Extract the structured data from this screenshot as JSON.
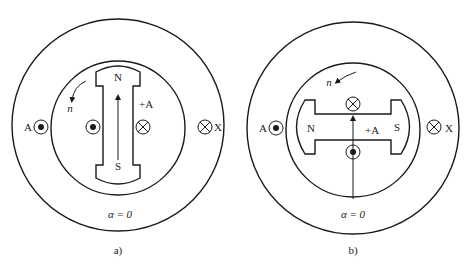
{
  "figure_a": {
    "caption": "a)",
    "angle_label": "α = 0",
    "rotor_north": "N",
    "rotor_south": "S",
    "axis_label": "+A",
    "rotation_label": "n",
    "coil_start": "A",
    "coil_end": "X"
  },
  "figure_b": {
    "caption": "b)",
    "angle_label": "α = 0",
    "rotor_north": "N",
    "rotor_south": "S",
    "axis_label": "+A",
    "rotation_label": "n",
    "coil_start": "A",
    "coil_end": "X"
  },
  "symbols": {
    "current_out": "dot-in-circle",
    "current_in": "cross-in-circle"
  }
}
